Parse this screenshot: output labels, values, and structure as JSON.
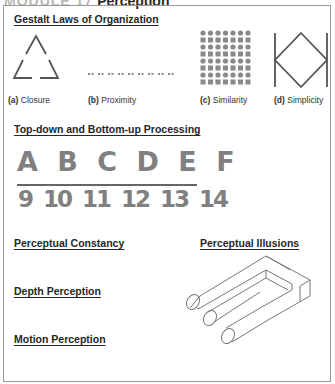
{
  "header": {
    "module": "MODULE 17",
    "title": "Perception"
  },
  "sections": {
    "gestalt": {
      "title": "Gestalt Laws of Organization",
      "figures": [
        {
          "letter": "(a)",
          "label": "Closure"
        },
        {
          "letter": "(b)",
          "label": "Proximity"
        },
        {
          "letter": "(c)",
          "label": "Similarity"
        },
        {
          "letter": "(d)",
          "label": "Simplicity"
        }
      ]
    },
    "processing": {
      "title": "Top-down and Bottom-up Processing",
      "letters_row": "A B C D E F",
      "numbers_row": "9 10 11 12 13 14"
    },
    "constancy": {
      "title": "Perceptual Constancy"
    },
    "illusions": {
      "title": "Perceptual Illusions"
    },
    "depth": {
      "title": "Depth Perception"
    },
    "motion": {
      "title": "Motion Perception"
    }
  },
  "colors": {
    "figure_gray": "#7a7a7a",
    "stroke_dark": "#555555",
    "border": "#9a9a9a"
  }
}
